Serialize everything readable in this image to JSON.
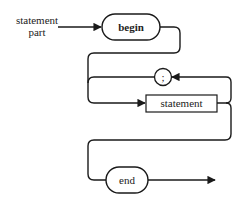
{
  "diagram": {
    "type": "syntax-diagram",
    "title_label": {
      "line1": "statement",
      "line2": "part"
    },
    "nodes": [
      {
        "id": "begin",
        "label": "begin",
        "shape": "rounded"
      },
      {
        "id": "semicolon",
        "label": ";",
        "shape": "circle"
      },
      {
        "id": "statement",
        "label": "statement",
        "shape": "rectangle"
      },
      {
        "id": "end",
        "label": "end",
        "shape": "rounded"
      }
    ],
    "edges": [
      {
        "from": "entry",
        "to": "begin"
      },
      {
        "from": "begin",
        "to": "statement"
      },
      {
        "from": "statement",
        "to": "semicolon",
        "note": "loop back"
      },
      {
        "from": "semicolon",
        "to": "statement"
      },
      {
        "from": "statement",
        "to": "end"
      },
      {
        "from": "end",
        "to": "exit"
      }
    ],
    "colors": {
      "stroke": "#1a1a1a",
      "background": "#ffffff"
    }
  }
}
